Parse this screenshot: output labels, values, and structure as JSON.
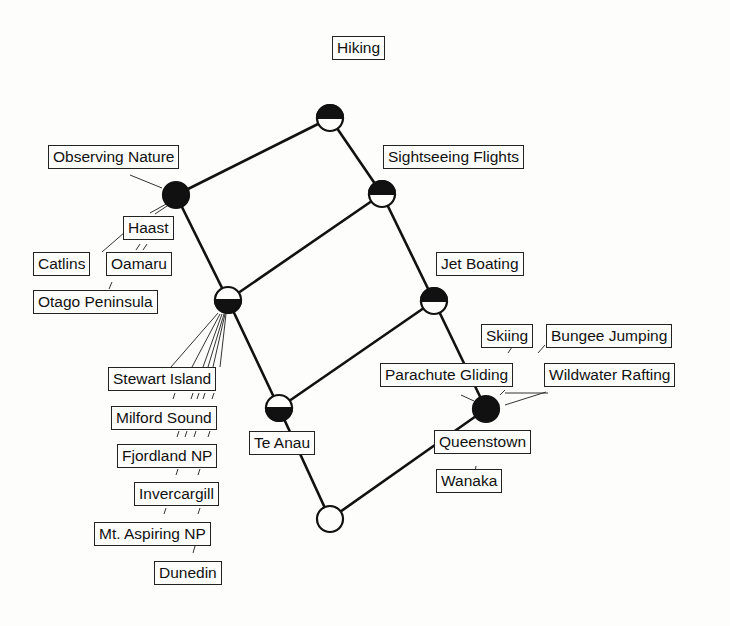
{
  "diagram_type": "concept lattice",
  "attributes": {
    "hiking": "Hiking",
    "observing_nature": "Observing Nature",
    "sightseeing_flights": "Sightseeing Flights",
    "jet_boating": "Jet Boating",
    "skiing": "Skiing",
    "bungee_jumping": "Bungee Jumping",
    "parachute_gliding": "Parachute Gliding",
    "wildwater_rafting": "Wildwater Rafting"
  },
  "objects": {
    "haast": "Haast",
    "catlins": "Catlins",
    "oamaru": "Oamaru",
    "otago_peninsula": "Otago Peninsula",
    "stewart_island": "Stewart Island",
    "milford_sound": "Milford Sound",
    "fjordland_np": "Fjordland NP",
    "invercargill": "Invercargill",
    "mt_aspiring_np": "Mt. Aspiring NP",
    "dunedin": "Dunedin",
    "te_anau": "Te Anau",
    "queenstown": "Queenstown",
    "wanaka": "Wanaka"
  },
  "nodes": [
    {
      "id": "top",
      "x": 330,
      "y": 118,
      "style": "top-black"
    },
    {
      "id": "nature",
      "x": 176,
      "y": 195,
      "style": "full-black"
    },
    {
      "id": "flights",
      "x": 382,
      "y": 194,
      "style": "top-black"
    },
    {
      "id": "mid",
      "x": 228,
      "y": 300,
      "style": "bottom-black"
    },
    {
      "id": "jet",
      "x": 434,
      "y": 301,
      "style": "top-black"
    },
    {
      "id": "teanau",
      "x": 279,
      "y": 408,
      "style": "bottom-black"
    },
    {
      "id": "queenstown",
      "x": 486,
      "y": 409,
      "style": "full-black"
    },
    {
      "id": "bottom",
      "x": 330,
      "y": 519,
      "style": "white"
    }
  ],
  "edges": [
    [
      "top",
      "nature"
    ],
    [
      "top",
      "flights"
    ],
    [
      "nature",
      "mid"
    ],
    [
      "flights",
      "mid"
    ],
    [
      "flights",
      "jet"
    ],
    [
      "mid",
      "teanau"
    ],
    [
      "jet",
      "teanau"
    ],
    [
      "jet",
      "queenstown"
    ],
    [
      "teanau",
      "bottom"
    ],
    [
      "queenstown",
      "bottom"
    ]
  ]
}
